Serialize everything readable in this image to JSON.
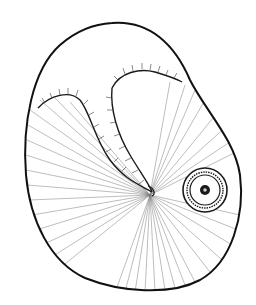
{
  "image": {
    "subject": "line drawing of a seed with a fold and a circular hilum mark",
    "colors": {
      "background": "#ffffff",
      "ink": "#1a1a1a",
      "hatch": "#6a6a6a"
    }
  }
}
